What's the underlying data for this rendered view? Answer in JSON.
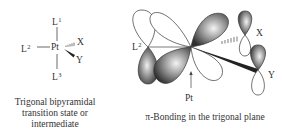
{
  "left_panel": {
    "title": "Trigonal bipyramidal transition state or intermediate",
    "caption_lines": [
      "Trigonal bipyramidal",
      "transition state or",
      "intermediate"
    ],
    "center_atom": "Pt",
    "ligands": {
      "L1": {
        "base": "L",
        "sup": "1",
        "position": "axial-top"
      },
      "L2": {
        "base": "L",
        "sup": "2",
        "position": "equatorial-left"
      },
      "L3": {
        "base": "L",
        "sup": "3",
        "position": "axial-bottom"
      },
      "X": {
        "base": "X",
        "sup": "",
        "position": "equatorial-back",
        "bond": "hashed"
      },
      "Y": {
        "base": "Y",
        "sup": "",
        "position": "equatorial-front",
        "bond": "wedge"
      }
    }
  },
  "right_panel": {
    "caption": "π-Bonding in the trigonal plane",
    "pt_label": "Pt",
    "l2_label": {
      "base": "L",
      "sup": "2"
    },
    "x_label": "X",
    "y_label": "Y",
    "colors": {
      "lobe_shaded_dark": "#3a3a3a",
      "lobe_shaded_light": "#f2f2f2",
      "lobe_outline": "#333333",
      "lobe_unshaded": "#ffffff"
    }
  }
}
